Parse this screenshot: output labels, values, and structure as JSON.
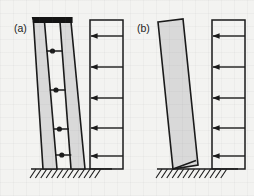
{
  "figure": {
    "name": "shear-wall-lateral-load-comparison",
    "width": 254,
    "height": 196,
    "background_color": "#f3f3f1",
    "wall_fill_color": "#d9d9d9",
    "line_color": "#1a1a1a",
    "cap_beam_color": "#141414"
  },
  "panels": [
    {
      "id": "a",
      "label": "(a)",
      "label_x": 14,
      "label_y": 32,
      "description": "coupled shear walls with connecting link beams and rigid cap beam",
      "wall": {
        "type": "coupled-piers",
        "pier_count": 2,
        "tilt_direction": "right",
        "piers": [
          {
            "name": "left-pier",
            "points": "33.5,22 44.5,22 57,169 43,169"
          },
          {
            "name": "right-pier",
            "points": "60,22 71,22 85,169 71,169"
          }
        ],
        "cap_beam": {
          "name": "cap-beam",
          "points": "32.5,17.5 72,17.5 72,22.5 33.5,22.5",
          "color": "#141414"
        },
        "coupling_beams": [
          {
            "x1": 46.5,
            "y1": 51,
            "x2": 62.2,
            "y2": 51
          },
          {
            "x1": 49.8,
            "y1": 90,
            "x2": 65.6,
            "y2": 90
          },
          {
            "x1": 53.1,
            "y1": 129,
            "x2": 69.0,
            "y2": 129
          },
          {
            "x1": 55.3,
            "y1": 155,
            "x2": 71.3,
            "y2": 155
          }
        ],
        "hinge_dots": [
          {
            "cx": 52.5,
            "cy": 51,
            "r": 2.6
          },
          {
            "cx": 56.0,
            "cy": 90,
            "r": 2.6
          },
          {
            "cx": 59.4,
            "cy": 129,
            "r": 2.6
          },
          {
            "cx": 61.8,
            "cy": 155,
            "r": 2.6
          }
        ]
      },
      "ground": {
        "name": "fixed-base-support",
        "line_x1": 31,
        "line_x2": 112,
        "line_y": 169,
        "hatch_count": 13,
        "hatch_start_x": 36,
        "hatch_step": 5.4,
        "hatch_dx": -6,
        "hatch_dy": 9
      },
      "load": {
        "name": "lateral-load-diagram",
        "box": {
          "x": 90,
          "y": 20,
          "width": 33,
          "height": 149
        },
        "arrow_direction": "left",
        "arrow_count": 5,
        "arrows": [
          {
            "y": 36,
            "x_tail": 123,
            "x_head": 91
          },
          {
            "y": 67,
            "x_tail": 123,
            "x_head": 91
          },
          {
            "y": 98,
            "x_tail": 123,
            "x_head": 91
          },
          {
            "y": 128,
            "x_tail": 123,
            "x_head": 91
          },
          {
            "y": 156,
            "x_tail": 123,
            "x_head": 91
          }
        ]
      }
    },
    {
      "id": "b",
      "label": "(b)",
      "label_x": 137,
      "label_y": 32,
      "description": "single monolithic cantilever shear wall",
      "wall": {
        "type": "monolithic-cantilever",
        "pier_count": 1,
        "tilt_direction": "right",
        "piers": [
          {
            "name": "cantilever-wall",
            "points": "158,22 183,19 198,165 173,169"
          }
        ],
        "base_chord": {
          "x1": 173,
          "y1": 169,
          "x2": 196,
          "y2": 160.5
        },
        "coupling_beams": [],
        "hinge_dots": []
      },
      "ground": {
        "name": "fixed-base-support",
        "line_x1": 157,
        "line_x2": 238,
        "line_y": 169,
        "hatch_count": 13,
        "hatch_start_x": 162,
        "hatch_step": 5.4,
        "hatch_dx": -6,
        "hatch_dy": 9
      },
      "load": {
        "name": "lateral-load-diagram",
        "box": {
          "x": 212,
          "y": 20,
          "width": 33,
          "height": 149
        },
        "arrow_direction": "left",
        "arrow_count": 5,
        "arrows": [
          {
            "y": 36,
            "x_tail": 245,
            "x_head": 213
          },
          {
            "y": 67,
            "x_tail": 245,
            "x_head": 213
          },
          {
            "y": 98,
            "x_tail": 245,
            "x_head": 213
          },
          {
            "y": 128,
            "x_tail": 245,
            "x_head": 213
          },
          {
            "y": 156,
            "x_tail": 245,
            "x_head": 213
          }
        ]
      }
    }
  ]
}
